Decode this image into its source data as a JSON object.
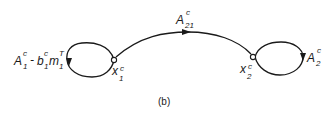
{
  "diagram": {
    "caption": "(b)",
    "nodes": [
      {
        "id": "x1",
        "label": "x",
        "sub": "1",
        "sup": "c",
        "cx": 114,
        "cy": 60
      },
      {
        "id": "x2",
        "label": "x",
        "sub": "2",
        "sup": "c",
        "cx": 253,
        "cy": 57
      }
    ],
    "edges": [
      {
        "from": "x1",
        "to": "x1",
        "type": "self-loop",
        "label": {
          "parts": [
            {
              "base": "A",
              "sub": "1",
              "sup": "c"
            },
            {
              "base": " - b",
              "sub": "1",
              "sup": "c"
            },
            {
              "base": "m",
              "sub": "1",
              "sup": "T"
            }
          ]
        }
      },
      {
        "from": "x1",
        "to": "x2",
        "type": "arc",
        "label": {
          "base": "A",
          "sub": "21",
          "sup": "c"
        }
      },
      {
        "from": "x2",
        "to": "x2",
        "type": "self-loop",
        "label": {
          "base": "A",
          "sub": "2",
          "sup": "c"
        }
      }
    ]
  },
  "labels": {
    "loop1": {
      "a_base": "A",
      "a_sub": "1",
      "a_sup": "c",
      "minus": "-",
      "b_base": "b",
      "b_sub": "1",
      "b_sup": "c",
      "m_base": "m",
      "m_sub": "1",
      "m_sup": "T"
    },
    "arc": {
      "base": "A",
      "sub": "21",
      "sup": "c"
    },
    "loop2": {
      "base": "A",
      "sub": "2",
      "sup": "c"
    },
    "node1": {
      "base": "x",
      "sub": "1",
      "sup": "c"
    },
    "node2": {
      "base": "x",
      "sub": "2",
      "sup": "c"
    }
  },
  "colors": {
    "stroke": "#1a1a1a",
    "background": "#ffffff"
  }
}
